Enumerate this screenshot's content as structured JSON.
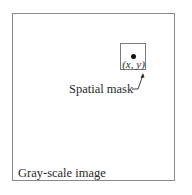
{
  "diagram": {
    "outer_box": {
      "label": "Gray-scale image"
    },
    "mask_box": {
      "label": "Spatial mask",
      "point_label": "(x, y)"
    },
    "colors": {
      "border": "#8a8a8a",
      "text": "#2a2a2a",
      "dot": "#111111"
    }
  }
}
